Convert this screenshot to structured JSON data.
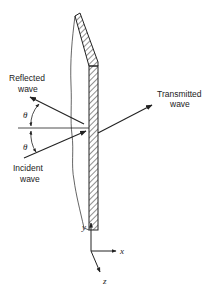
{
  "diagram": {
    "type": "wave-at-interface",
    "labels": {
      "reflected": [
        "Reflected",
        "wave"
      ],
      "incident": [
        "Incident",
        "wave"
      ],
      "transmitted": [
        "Transmitted",
        "wave"
      ],
      "angle_top": "θ",
      "angle_bottom": "θ"
    },
    "axes": {
      "y": "y",
      "x": "x",
      "z": "z"
    },
    "colors": {
      "line": "#222222",
      "background": "#ffffff"
    }
  }
}
